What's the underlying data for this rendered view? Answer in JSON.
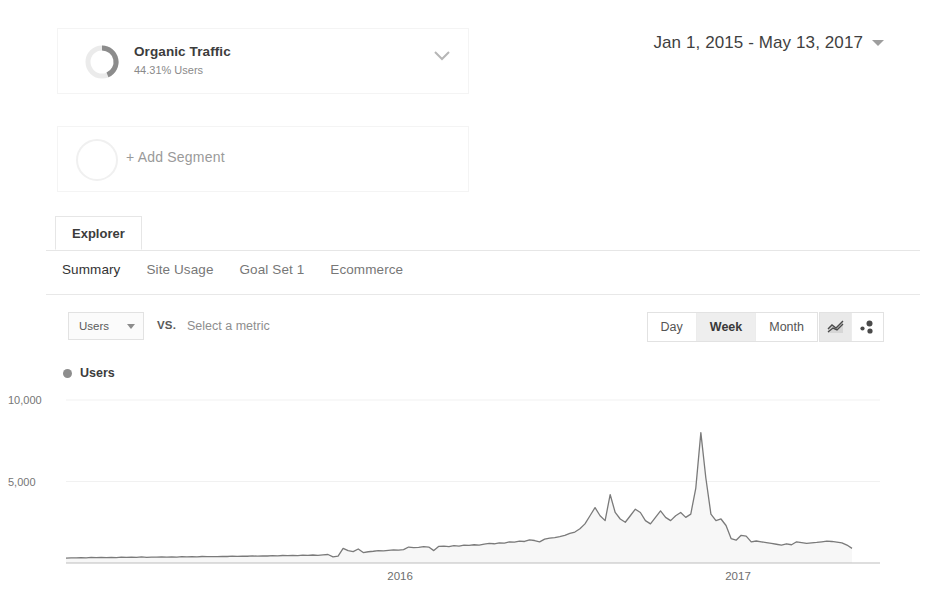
{
  "segments": {
    "primary": {
      "name": "Organic Traffic",
      "subtitle": "44.31% Users",
      "percent": 44.31,
      "ring_color": "#8c8c8c",
      "ring_track": "#ebebeb",
      "chevron_icon": "chevron-down-icon"
    },
    "add": {
      "label": "+ Add Segment",
      "ring_track": "#f0f0f0"
    }
  },
  "date_range": {
    "text": "Jan 1, 2015 - May 13, 2017",
    "caret_icon": "caret-down-icon"
  },
  "tabs": {
    "explorer": "Explorer"
  },
  "subtabs": [
    {
      "label": "Summary",
      "active": true
    },
    {
      "label": "Site Usage",
      "active": false
    },
    {
      "label": "Goal Set 1",
      "active": false
    },
    {
      "label": "Ecommerce",
      "active": false
    }
  ],
  "metric_row": {
    "primary_metric": "Users",
    "vs_label": "VS.",
    "secondary_metric_placeholder": "Select a metric",
    "granularity": [
      {
        "label": "Day",
        "active": false
      },
      {
        "label": "Week",
        "active": true
      },
      {
        "label": "Month",
        "active": false
      }
    ],
    "chart_types": [
      {
        "icon": "line-chart-icon",
        "active": true
      },
      {
        "icon": "motion-chart-icon",
        "active": false
      }
    ]
  },
  "legend": {
    "series_label": "Users",
    "dot_color": "#8d8d8d"
  },
  "chart_data": {
    "type": "area",
    "title": "Users",
    "xlabel": "",
    "ylabel": "Users",
    "ylim": [
      0,
      10000
    ],
    "ytick_labels": [
      "10,000",
      "5,000"
    ],
    "ytick_values": [
      10000,
      5000
    ],
    "grid": true,
    "legend_position": "top-left",
    "line_color": "#7a7a7a",
    "fill_color": "#f7f7f7",
    "x_axis_type": "date",
    "x_range": [
      "2015-01-01",
      "2017-05-13"
    ],
    "xtick_labels": [
      "2016",
      "2017"
    ],
    "xtick_values": [
      "2016-01-01",
      "2017-01-01"
    ],
    "series": [
      {
        "name": "Users",
        "values": [
          300,
          320,
          310,
          335,
          315,
          340,
          330,
          350,
          325,
          345,
          335,
          360,
          340,
          355,
          345,
          370,
          350,
          365,
          355,
          380,
          360,
          375,
          365,
          390,
          370,
          385,
          380,
          400,
          385,
          395,
          390,
          410,
          400,
          420,
          405,
          425,
          415,
          435,
          420,
          440,
          430,
          450,
          440,
          460,
          450,
          470,
          455,
          480,
          465,
          490,
          470,
          500,
          520,
          380,
          420,
          900,
          760,
          700,
          860,
          640,
          690,
          720,
          760,
          740,
          780,
          800,
          790,
          820,
          980,
          940,
          960,
          1000,
          980,
          760,
          1020,
          1040,
          1000,
          1060,
          1040,
          1100,
          1080,
          1120,
          1100,
          1160,
          1200,
          1180,
          1240,
          1220,
          1300,
          1280,
          1340,
          1320,
          1420,
          1380,
          1300,
          1460,
          1520,
          1560,
          1620,
          1700,
          1820,
          1900,
          2100,
          2400,
          2900,
          3400,
          2900,
          2600,
          4200,
          3100,
          2700,
          2500,
          2900,
          3300,
          3100,
          2600,
          2400,
          2800,
          3200,
          2800,
          2600,
          2900,
          3100,
          2800,
          3000,
          4600,
          8000,
          5200,
          3000,
          2600,
          2700,
          2300,
          1500,
          1400,
          1700,
          1650,
          1300,
          1350,
          1300,
          1250,
          1200,
          1150,
          1100,
          1180,
          1120,
          1300,
          1250,
          1200,
          1230,
          1260,
          1300,
          1340,
          1320,
          1280,
          1240,
          1100,
          900
        ]
      }
    ]
  }
}
